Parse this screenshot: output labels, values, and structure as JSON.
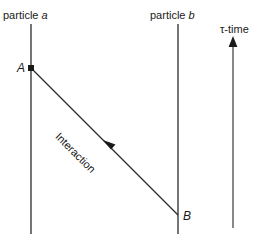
{
  "figure": {
    "background_color": "#ffffff",
    "line_color": "#3a3a3a",
    "text_color": "#1a1a1a",
    "worldlines": [
      {
        "id": "particle-a",
        "label_prefix": "particle ",
        "label_italic": "a",
        "label_full": "particle a",
        "x": 31,
        "y_top": 24,
        "y_bottom": 234
      },
      {
        "id": "particle-b",
        "label_prefix": "particle ",
        "label_italic": "b",
        "label_full": "particle b",
        "x": 178,
        "y_top": 24,
        "y_bottom": 234
      }
    ],
    "events": [
      {
        "id": "event-a",
        "label": "A",
        "x": 31,
        "y": 68,
        "marker": "filled-square"
      },
      {
        "id": "event-b",
        "label": "B",
        "x": 178,
        "y": 215,
        "marker": "none"
      }
    ],
    "interaction": {
      "label": "Interaction",
      "from_x": 31,
      "from_y": 68,
      "to_x": 178,
      "to_y": 215,
      "arrow_direction": "toward-A",
      "arrow_tip_x": 103,
      "arrow_tip_y": 140
    },
    "time_axis": {
      "label_tau": "τ",
      "label_rest": "-time",
      "label_full": "τ-time",
      "x": 233,
      "y_top": 40,
      "y_bottom": 228,
      "direction": "up"
    }
  }
}
